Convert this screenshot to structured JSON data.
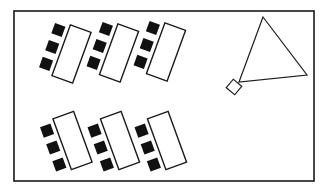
{
  "diagram": {
    "type": "classroom-seating-layout",
    "canvas": {
      "width": 326,
      "height": 193,
      "background": "#ffffff"
    },
    "colors": {
      "stroke": "#1a1a1a",
      "chair_fill": "#111111",
      "desk_fill": "#ffffff"
    },
    "room": {
      "x": 14,
      "y": 11,
      "width": 300,
      "height": 170,
      "stroke_width": 1.6
    },
    "desk_size": {
      "width": 22,
      "height": 54
    },
    "chair_size": 11,
    "desk_groups": [
      {
        "id": "top-1",
        "cx": 71.5,
        "cy": 54,
        "angle": 20
      },
      {
        "id": "top-2",
        "cx": 119,
        "cy": 53,
        "angle": 20
      },
      {
        "id": "top-3",
        "cx": 166,
        "cy": 52,
        "angle": 20
      },
      {
        "id": "bottom-1",
        "cx": 72.5,
        "cy": 140.5,
        "angle": -20
      },
      {
        "id": "bottom-2",
        "cx": 120,
        "cy": 140.5,
        "angle": -20
      },
      {
        "id": "bottom-3",
        "cx": 167,
        "cy": 140.5,
        "angle": -20
      }
    ],
    "chairs_per_desk": 3,
    "teacher_area": {
      "triangle": {
        "points": [
          [
            263,
            17
          ],
          [
            307,
            75
          ],
          [
            239,
            82
          ]
        ]
      },
      "podium": {
        "cx": 234,
        "cy": 87,
        "size": 11,
        "angle": 40
      }
    }
  }
}
